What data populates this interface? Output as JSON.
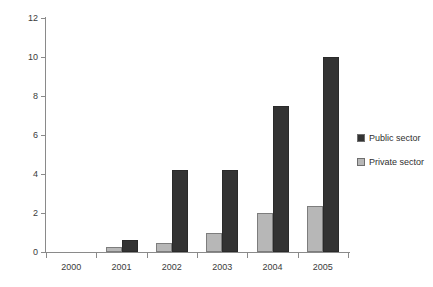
{
  "chart_data": {
    "type": "bar",
    "title": "",
    "xlabel": "",
    "ylabel": "",
    "categories": [
      "2000",
      "2001",
      "2002",
      "2003",
      "2004",
      "2005"
    ],
    "series": [
      {
        "name": "Private sector",
        "color": "#b7b7b7",
        "values": [
          0,
          0.25,
          0.45,
          1.0,
          2.0,
          2.35
        ]
      },
      {
        "name": "Public sector",
        "color": "#333333",
        "values": [
          0,
          0.6,
          4.2,
          4.2,
          7.5,
          10.0
        ]
      }
    ],
    "ylim": [
      0,
      12
    ],
    "yticks": [
      "0",
      "2",
      "4",
      "6",
      "8",
      "10",
      "12"
    ],
    "ytick_values": [
      0,
      2,
      4,
      6,
      8,
      10,
      12
    ],
    "grid": false,
    "legend_position": "right"
  },
  "legend": {
    "items": [
      {
        "label": "Public sector",
        "swatch": "public"
      },
      {
        "label": "Private sector",
        "swatch": "private"
      }
    ]
  },
  "axes": {
    "y_axis_name": "y-axis",
    "x_axis_name": "x-axis"
  },
  "top_sliver_text": ""
}
